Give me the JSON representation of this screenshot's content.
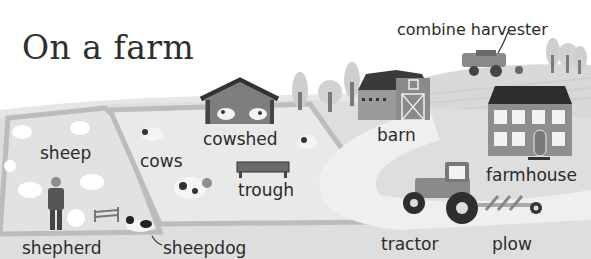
{
  "title": "On a farm",
  "labels": {
    "combine_harvester": "combine harvester",
    "sheep": "sheep",
    "cows": "cows",
    "cowshed": "cowshed",
    "barn": "barn",
    "trough": "trough",
    "farmhouse": "farmhouse",
    "shepherd": "shepherd",
    "sheepdog": "sheepdog",
    "tractor": "tractor",
    "plow": "plow"
  },
  "colors": {
    "background": "#ffffff",
    "field": "#dcdcdc",
    "path": "#ececec",
    "hedge": "#bdbdbd",
    "roof": "#333333",
    "building": "#8a8a8a",
    "text": "#2b2b2b"
  }
}
